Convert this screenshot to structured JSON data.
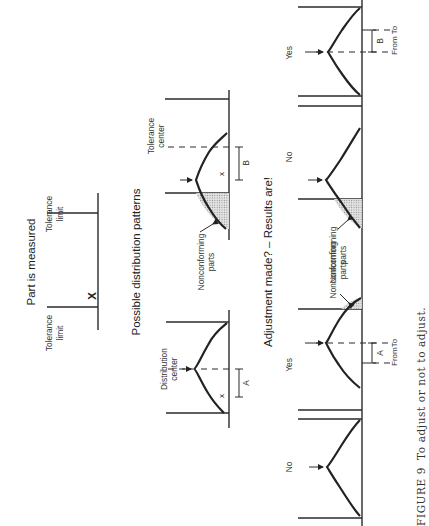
{
  "figure": {
    "number_label": "FIGURE 9",
    "caption": "To adjust or not to adjust.",
    "orientation": "rotated 90° counter-clockwise (text reads bottom-to-top)"
  },
  "section_part_measured": {
    "heading": "Part is measured",
    "tolerance_limit_upper_line1": "Tolerance",
    "tolerance_limit_upper_line2": "limit",
    "tolerance_limit_lower_line1": "Tolerance",
    "tolerance_limit_lower_line2": "limit",
    "measurement_mark": "X"
  },
  "section_distribution_patterns": {
    "heading": "Possible distribution patterns",
    "pattern_a": {
      "label_line1": "Distribution",
      "label_line2": "center",
      "offset_label": "A",
      "mark": "x"
    },
    "pattern_b": {
      "label_line1": "Tolerance",
      "label_line2": "center",
      "offset_label": "B",
      "mark": "x",
      "nonconforming_line1": "Nonconforming",
      "nonconforming_line2": "parts"
    }
  },
  "section_adjustment": {
    "heading": "Adjustment made? – Results are!",
    "panels": [
      {
        "id": "a-no",
        "answer": "No"
      },
      {
        "id": "a-yes",
        "answer": "Yes",
        "offset_label": "A",
        "from_label": "From",
        "to_label": "To",
        "nonconforming_line1": "Nonconforming",
        "nonconforming_line2": "parts"
      },
      {
        "id": "b-no",
        "answer": "No",
        "nonconforming_line1": "Nonconforming",
        "nonconforming_line2": "parts"
      },
      {
        "id": "b-yes",
        "answer": "Yes",
        "offset_label": "B",
        "from_label": "From",
        "to_label": "To"
      }
    ]
  }
}
